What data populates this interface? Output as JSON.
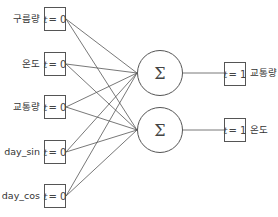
{
  "inputs": [
    {
      "label": "구름량",
      "time": "t = 0",
      "t_var": "t",
      "t_val": "= 0",
      "cy": 19
    },
    {
      "label": "온도",
      "time": "t = 0",
      "t_var": "t",
      "t_val": "= 0",
      "cy": 64
    },
    {
      "label": "교통량",
      "time": "t = 0",
      "t_var": "t",
      "t_val": "= 0",
      "cy": 107
    },
    {
      "label": "day_sin",
      "time": "t = 0",
      "t_var": "t",
      "t_val": "= 0",
      "cy": 152
    },
    {
      "label": "day_cos",
      "time": "t = 0",
      "t_var": "t",
      "t_val": "= 0",
      "cy": 196
    }
  ],
  "nodes": [
    {
      "symbol": "Σ",
      "cx": 160,
      "cy": 73
    },
    {
      "symbol": "Σ",
      "cx": 160,
      "cy": 130
    }
  ],
  "outputs": [
    {
      "label": "교통량",
      "time": "t = 1",
      "t_var": "t",
      "t_val": "= 1",
      "cy": 73
    },
    {
      "label": "온도",
      "time": "t = 1",
      "t_var": "t",
      "t_val": "= 1",
      "cy": 130
    }
  ],
  "colors": {
    "stroke": "#555555",
    "text": "#333333",
    "background": "#ffffff"
  }
}
